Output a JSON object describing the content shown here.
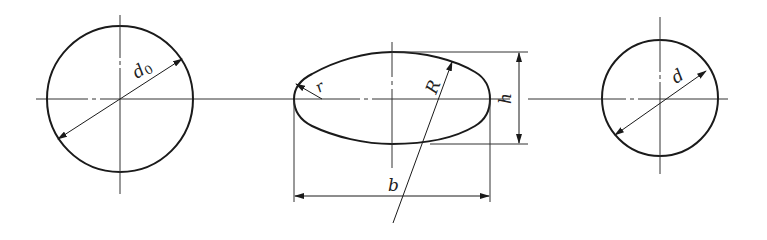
{
  "diagram": {
    "colors": {
      "stroke": "#1a1a1a",
      "thin": "#333333",
      "background": "#ffffff"
    },
    "left_circle": {
      "label_main": "d",
      "label_sub": "0",
      "dimension": "diameter d0"
    },
    "middle_oval": {
      "labels": {
        "width": "b",
        "height": "h",
        "big_radius": "R",
        "small_radius": "r"
      }
    },
    "right_circle": {
      "label": "d",
      "dimension": "diameter d"
    }
  }
}
